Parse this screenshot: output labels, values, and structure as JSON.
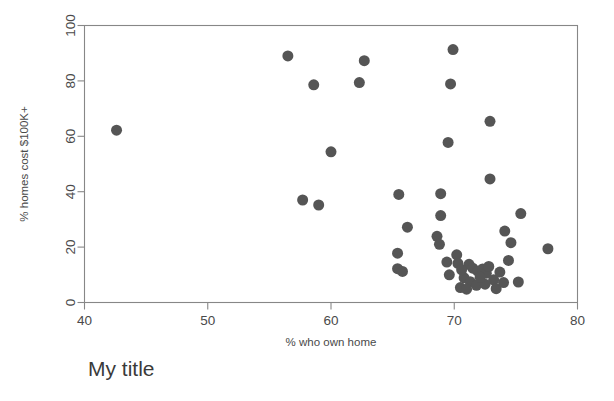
{
  "chart_data": {
    "type": "scatter",
    "title": "My title",
    "xlabel": "% who own home",
    "ylabel": "% homes cost $100K+",
    "xlim": [
      40,
      80
    ],
    "ylim": [
      0,
      100
    ],
    "xticks": [
      40,
      50,
      60,
      70,
      80
    ],
    "yticks": [
      0,
      20,
      40,
      60,
      80,
      100
    ],
    "xtick_labels": [
      "40",
      "50",
      "60",
      "70",
      "80"
    ],
    "ytick_labels": [
      "0",
      "20",
      "40",
      "60",
      "80",
      "100"
    ],
    "grid": false,
    "legend": null,
    "marker": {
      "shape": "circle",
      "color": "#555555",
      "size_px": 11
    },
    "series": [
      {
        "name": "states",
        "points": [
          [
            42.6,
            62.2
          ],
          [
            56.5,
            89.0
          ],
          [
            58.6,
            78.6
          ],
          [
            62.7,
            87.3
          ],
          [
            62.3,
            79.4
          ],
          [
            69.9,
            91.3
          ],
          [
            69.7,
            78.9
          ],
          [
            72.9,
            65.4
          ],
          [
            69.5,
            57.8
          ],
          [
            60.0,
            54.4
          ],
          [
            72.9,
            44.6
          ],
          [
            57.7,
            37.0
          ],
          [
            59.0,
            35.2
          ],
          [
            65.5,
            39.0
          ],
          [
            68.9,
            39.3
          ],
          [
            75.4,
            32.1
          ],
          [
            74.1,
            25.8
          ],
          [
            65.4,
            17.8
          ],
          [
            66.2,
            27.2
          ],
          [
            68.9,
            31.4
          ],
          [
            68.6,
            23.9
          ],
          [
            68.8,
            21.0
          ],
          [
            74.6,
            21.6
          ],
          [
            77.6,
            19.4
          ],
          [
            65.4,
            12.2
          ],
          [
            65.8,
            11.2
          ],
          [
            69.6,
            10.0
          ],
          [
            74.4,
            15.2
          ],
          [
            70.2,
            17.2
          ],
          [
            70.3,
            14.1
          ],
          [
            71.2,
            13.8
          ],
          [
            71.5,
            12.4
          ],
          [
            71.9,
            11.3
          ],
          [
            72.3,
            12.1
          ],
          [
            72.6,
            10.6
          ],
          [
            70.8,
            8.9
          ],
          [
            71.3,
            7.5
          ],
          [
            70.5,
            5.4
          ],
          [
            71.0,
            4.8
          ],
          [
            71.8,
            6.2
          ],
          [
            72.5,
            6.6
          ],
          [
            73.2,
            8.2
          ],
          [
            73.4,
            5.0
          ],
          [
            74.0,
            7.2
          ],
          [
            75.2,
            7.4
          ],
          [
            69.4,
            14.6
          ],
          [
            70.6,
            11.8
          ],
          [
            72.1,
            9.1
          ],
          [
            72.8,
            13.0
          ],
          [
            73.7,
            11.0
          ]
        ]
      }
    ]
  }
}
